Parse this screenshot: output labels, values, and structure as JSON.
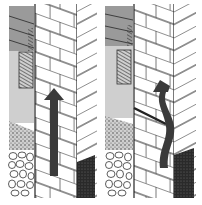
{
  "figure": {
    "panels": [
      {
        "id": "left",
        "label": "",
        "arrow": "straight-up",
        "layers": [
          "gray-hatched-panel",
          "wood-lath-hatched",
          "light-gray-plaster",
          "gravel-fill",
          "stone-rubble",
          "brick-wall",
          "dark-soil-block"
        ]
      },
      {
        "id": "right",
        "label": "",
        "arrow": "wavy-up",
        "layers": [
          "gray-hatched-panel",
          "wood-lath-hatched",
          "light-gray-plaster",
          "gravel-fill",
          "stone-rubble",
          "brick-wall-with-dpc",
          "dark-soil-block"
        ]
      }
    ],
    "colors": {
      "line": "#222222",
      "mid_gray": "#9a9a9a",
      "light_gray": "#cfcfcf",
      "dark_arrow": "#3a3a3a",
      "soil": "#2a2a2a",
      "background": "#ffffff"
    }
  }
}
